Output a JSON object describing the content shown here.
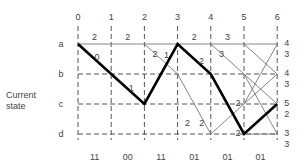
{
  "side_label": [
    "Current",
    "state"
  ],
  "time_steps": [
    "0",
    "1",
    "2",
    "3",
    "4",
    "5",
    "6"
  ],
  "states": [
    "a",
    "b",
    "c",
    "d"
  ],
  "received_symbols": [
    "11",
    "00",
    "11",
    "01",
    "01",
    "01"
  ],
  "final_metrics": {
    "a": [
      "4",
      "3"
    ],
    "b": [
      "4",
      "3"
    ],
    "c": [
      "5",
      "2"
    ],
    "d": [
      "3",
      "3"
    ]
  },
  "survivor_path": [
    [
      "a",
      0
    ],
    [
      "b",
      1
    ],
    [
      "c",
      2
    ],
    [
      "a",
      3
    ],
    [
      "b",
      4
    ],
    [
      "d",
      5
    ],
    [
      "c",
      6
    ]
  ],
  "branches": [
    {
      "from": [
        "a",
        0
      ],
      "to": [
        "a",
        1
      ],
      "label": "2"
    },
    {
      "from": [
        "a",
        1
      ],
      "to": [
        "a",
        2
      ],
      "label": "2"
    },
    {
      "from": [
        "a",
        2
      ],
      "to": [
        "a",
        3
      ],
      "label": ""
    },
    {
      "from": [
        "a",
        3
      ],
      "to": [
        "a",
        4
      ],
      "label": "2"
    },
    {
      "from": [
        "a",
        4
      ],
      "to": [
        "a",
        5
      ],
      "label": "3"
    },
    {
      "from": [
        "a",
        5
      ],
      "to": [
        "a",
        6
      ],
      "label": ""
    },
    {
      "from": [
        "a",
        2
      ],
      "to": [
        "b",
        3
      ],
      "label": "2"
    },
    {
      "from": [
        "b",
        3
      ],
      "to": [
        "d",
        4
      ],
      "label": "2"
    },
    {
      "from": [
        "a",
        4
      ],
      "to": [
        "b",
        5
      ],
      "label": "3"
    },
    {
      "from": [
        "a",
        5
      ],
      "to": [
        "b",
        6
      ],
      "label": ""
    },
    {
      "from": [
        "b",
        5
      ],
      "to": [
        "d",
        6
      ],
      "label": ""
    },
    {
      "from": [
        "b",
        5
      ],
      "to": [
        "c",
        6
      ],
      "label": ""
    },
    {
      "from": [
        "d",
        4
      ],
      "to": [
        "c",
        5
      ],
      "label": ""
    },
    {
      "from": [
        "c",
        5
      ],
      "to": [
        "b",
        6
      ],
      "label": ""
    },
    {
      "from": [
        "c",
        5
      ],
      "to": [
        "a",
        6
      ],
      "label": ""
    },
    {
      "from": [
        "d",
        5
      ],
      "to": [
        "d",
        6
      ],
      "label": ""
    }
  ],
  "path_labels": [
    "0",
    "1",
    "1",
    "2",
    "2",
    "2"
  ],
  "extra_labels": [
    {
      "near": [
        "c",
        5
      ],
      "text": "2"
    }
  ]
}
